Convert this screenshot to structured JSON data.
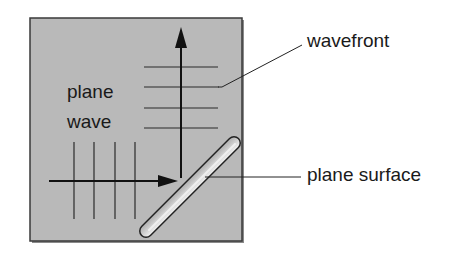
{
  "diagram": {
    "type": "plane wave reflection at a plane surface",
    "labels": {
      "plane_wave_line1": "plane",
      "plane_wave_line2": "wave",
      "wavefront": "wavefront",
      "plane_surface": "plane surface"
    },
    "colors": {
      "panel_fill": "#b9b9b9",
      "panel_border": "#3a3a3a",
      "line": "#1a1a1a",
      "background": "#ffffff"
    },
    "incident_wavefront_count": 4,
    "reflected_wavefront_count": 4
  }
}
